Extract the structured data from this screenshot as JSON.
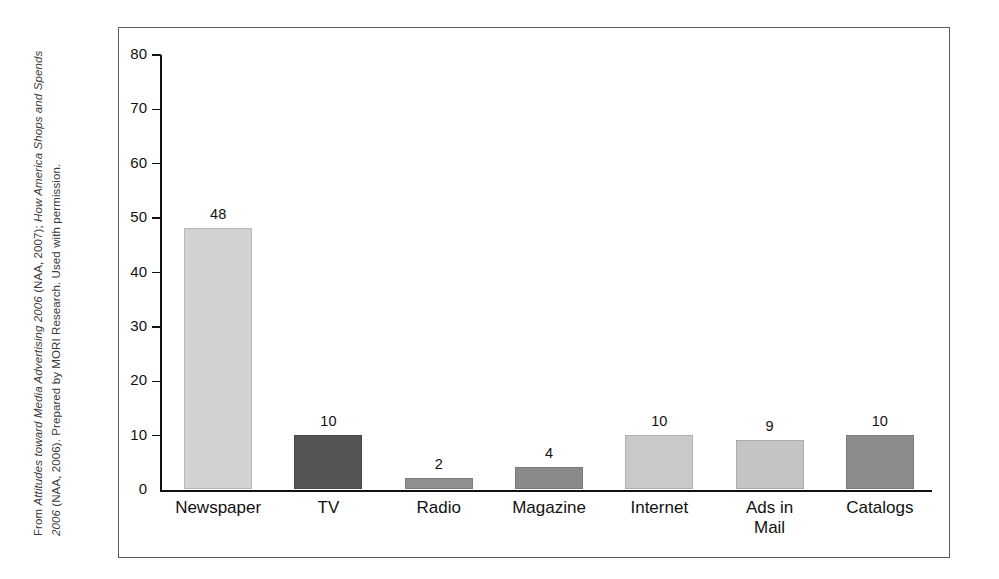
{
  "caption": {
    "segments": [
      {
        "text": "From ",
        "italic": false
      },
      {
        "text": "Attitudes toward Media Advertising 2006",
        "italic": true
      },
      {
        "text": " (NAA, 2007); ",
        "italic": false
      },
      {
        "text": "How America Shops and Spends 2006",
        "italic": true
      },
      {
        "text": " (NAA, 2006). Prepared by MORI Research. Used with permission.",
        "italic": false
      }
    ],
    "plain": "From Attitudes toward Media Advertising 2006 (NAA, 2007); How America Shops and Spends 2006 (NAA, 2006). Prepared by MORI Research. Used with permission."
  },
  "chart_data": {
    "type": "bar",
    "title": "",
    "xlabel": "",
    "ylabel": "",
    "ylim": [
      0,
      80
    ],
    "yticks": [
      0,
      10,
      20,
      30,
      40,
      50,
      60,
      70,
      80
    ],
    "ytick_labels": [
      "0",
      "10",
      "20",
      "30",
      "40",
      "50",
      "60",
      "70",
      "80"
    ],
    "grid": false,
    "legend": false,
    "categories": [
      "Newspaper",
      "TV",
      "Radio",
      "Magazine",
      "Internet",
      "Ads in\nMail",
      "Catalogs"
    ],
    "values": [
      48,
      10,
      2,
      4,
      10,
      9,
      10
    ],
    "value_labels": [
      "48",
      "10",
      "2",
      "4",
      "10",
      "9",
      "10"
    ],
    "bar_colors": [
      "#d2d2d2",
      "#545454",
      "#8f8f8f",
      "#8a8a8a",
      "#c9c9c9",
      "#c4c4c4",
      "#8c8c8c"
    ]
  }
}
